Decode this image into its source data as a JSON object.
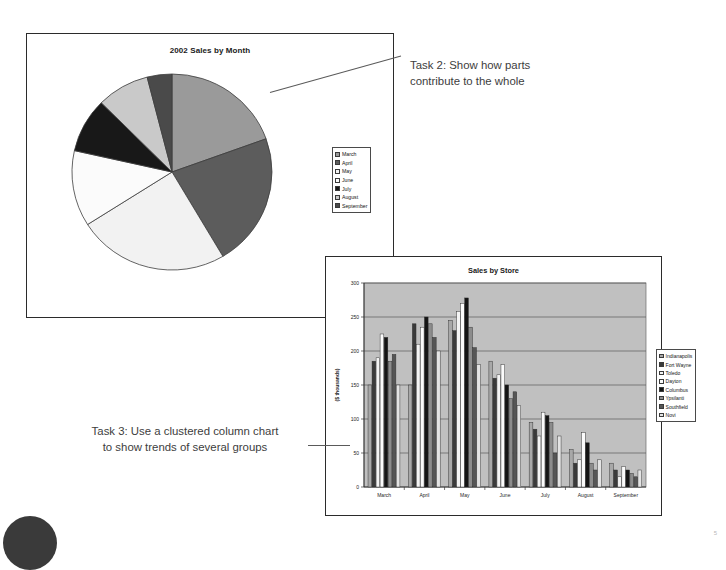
{
  "slide": {
    "corner_blob_color": "#3a3a3a",
    "page_mark": "5"
  },
  "annotations": {
    "task2": {
      "line1": "Task 2: Show how parts",
      "line2": "contribute to the whole"
    },
    "task3": {
      "line1": "Task 3: Use a clustered column chart",
      "line2": "to show trends of several groups"
    }
  },
  "pie_panel": {
    "title": "2002 Sales by Month",
    "legend_labels": [
      "March",
      "April",
      "May",
      "June",
      "July",
      "August",
      "September"
    ]
  },
  "bar_panel": {
    "title": "Sales by Store",
    "ylabel": "($ thousands)",
    "legend_labels": [
      "Indianapolis",
      "Fort Wayne",
      "Toledo",
      "Dayton",
      "Columbus",
      "Ypsilanti",
      "Southfield",
      "Novi"
    ]
  },
  "chart_data": [
    {
      "type": "pie",
      "title": "2002 Sales by Month",
      "labels": [
        "March",
        "April",
        "May",
        "June",
        "July",
        "August",
        "September"
      ],
      "values": [
        19.5,
        22.0,
        24.5,
        12.5,
        9.0,
        8.5,
        4.0
      ],
      "colors": [
        "#9a9a9a",
        "#5c5c5c",
        "#f2f2f2",
        "#fbfbfb",
        "#181818",
        "#c9c9c9",
        "#4a4a4a"
      ],
      "legend_position": "right",
      "start_angle": 0
    },
    {
      "type": "bar",
      "title": "Sales by Store",
      "xlabel": "",
      "ylabel": "($ thousands)",
      "ylim": [
        0,
        300
      ],
      "yticks": [
        0,
        50,
        100,
        150,
        200,
        250,
        300
      ],
      "grid": true,
      "plot_background": "#c0c0c0",
      "legend_position": "right",
      "categories": [
        "March",
        "April",
        "May",
        "June",
        "July",
        "August",
        "September"
      ],
      "series": [
        {
          "name": "Indianapolis",
          "color": "#a8a8a8",
          "values": [
            150,
            150,
            245,
            185,
            95,
            55,
            35
          ]
        },
        {
          "name": "Fort Wayne",
          "color": "#3a3a3a",
          "values": [
            185,
            240,
            230,
            160,
            85,
            35,
            25
          ]
        },
        {
          "name": "Toledo",
          "color": "#f4f4f4",
          "values": [
            190,
            210,
            258,
            165,
            75,
            40,
            15
          ]
        },
        {
          "name": "Dayton",
          "color": "#fbfbfb",
          "values": [
            225,
            235,
            270,
            180,
            110,
            80,
            30
          ]
        },
        {
          "name": "Columbus",
          "color": "#141414",
          "values": [
            220,
            250,
            278,
            150,
            105,
            65,
            25
          ]
        },
        {
          "name": "Ypsilanti",
          "color": "#8c8c8c",
          "values": [
            185,
            240,
            235,
            130,
            95,
            35,
            20
          ]
        },
        {
          "name": "Southfield",
          "color": "#555555",
          "values": [
            195,
            220,
            205,
            140,
            50,
            25,
            15
          ]
        },
        {
          "name": "Novi",
          "color": "#e4e4e4",
          "values": [
            150,
            200,
            180,
            120,
            75,
            40,
            25
          ]
        }
      ]
    }
  ]
}
